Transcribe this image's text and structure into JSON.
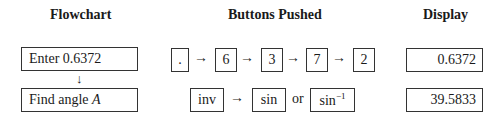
{
  "headers": {
    "flowchart": "Flowchart",
    "buttons": "Buttons Pushed",
    "display": "Display"
  },
  "rows": [
    {
      "flow_step": "Enter 0.6372",
      "buttons": [
        ".",
        "6",
        "3",
        "7",
        "2"
      ],
      "display": "0.6372"
    },
    {
      "flow_step_text": "Find angle ",
      "flow_step_var": "A",
      "buttons": [
        "inv",
        "sin",
        "sin"
      ],
      "inverse_exponent": "−1",
      "connector_or": "or",
      "display": "39.5833"
    }
  ],
  "arrow_right": "→",
  "arrow_down": "↓"
}
